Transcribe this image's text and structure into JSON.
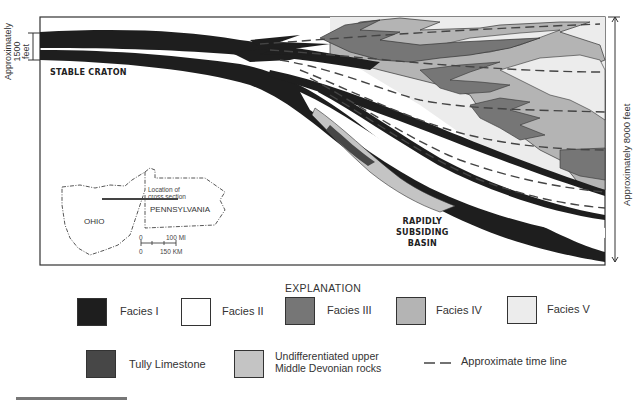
{
  "cross_section": {
    "left_scale_label": [
      "Approximately",
      "1500",
      "feet"
    ],
    "right_scale_label": "Approximately 8000 feet",
    "craton_label": "STABLE CRATON",
    "basin_label": [
      "RAPIDLY",
      "SUBSIDING",
      "BASIN"
    ]
  },
  "inset_map": {
    "states": [
      "OHIO",
      "PENNSYLVANIA"
    ],
    "location_label": [
      "Location of",
      "cross section"
    ],
    "scale": {
      "mi": "100 MI",
      "km": "150 KM",
      "zero": "0"
    }
  },
  "legend": {
    "title": "EXPLANATION",
    "items": [
      {
        "label": "Facies I",
        "color": "#1e1e1e"
      },
      {
        "label": "Facies II",
        "color": "#ffffff"
      },
      {
        "label": "Facies III",
        "color": "#767676"
      },
      {
        "label": "Facies IV",
        "color": "#b4b4b4"
      },
      {
        "label": "Facies V",
        "color": "#ececec"
      },
      {
        "label": "Tully Limestone",
        "color": "#474747"
      },
      {
        "label": "Undifferentiated upper Middle Devonian rocks",
        "label_lines": [
          "Undifferentiated upper",
          "Middle Devonian rocks"
        ],
        "color": "#c4c4c4"
      },
      {
        "label": "Approximate time line",
        "symbol": "dashed-line"
      }
    ]
  }
}
